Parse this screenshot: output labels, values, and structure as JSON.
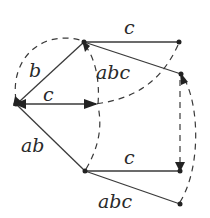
{
  "diagram": {
    "type": "automaton-graph",
    "nodes": [
      {
        "id": "A",
        "x": 84,
        "y": 42
      },
      {
        "id": "B",
        "x": 179,
        "y": 42
      },
      {
        "id": "C",
        "x": 181,
        "y": 74
      },
      {
        "id": "D",
        "x": 16,
        "y": 104
      },
      {
        "id": "E",
        "x": 88,
        "y": 104
      },
      {
        "id": "F",
        "x": 85,
        "y": 171
      },
      {
        "id": "G",
        "x": 180,
        "y": 171
      },
      {
        "id": "H",
        "x": 180,
        "y": 204
      }
    ],
    "solid_edges": [
      {
        "from": "A",
        "to": "B",
        "label": "c"
      },
      {
        "from": "A",
        "to": "C",
        "label": "abc"
      },
      {
        "from": "A",
        "to": "D",
        "label": "b"
      },
      {
        "from": "E",
        "to": "D",
        "label": "c"
      },
      {
        "from": "D",
        "to": "F",
        "label": "ab"
      },
      {
        "from": "F",
        "to": "G",
        "label": "c"
      },
      {
        "from": "F",
        "to": "H",
        "label": "abc"
      }
    ],
    "dashed_edges": [
      {
        "from": "D",
        "to": "A"
      },
      {
        "from": "E",
        "to": "A"
      },
      {
        "from": "B",
        "to": "E"
      },
      {
        "from": "F",
        "to": "E"
      },
      {
        "from": "C",
        "to": "G"
      },
      {
        "from": "H",
        "to": "C"
      }
    ],
    "labels": {
      "ab_c": "c",
      "ac_abc": "abc",
      "ad_b": "b",
      "de_c": "c",
      "df_ab": "ab",
      "fg_c": "c",
      "fh_abc": "abc"
    },
    "colors": {
      "stroke": "#3a3a3a",
      "text": "#2a2a2a",
      "background": "#ffffff"
    }
  }
}
